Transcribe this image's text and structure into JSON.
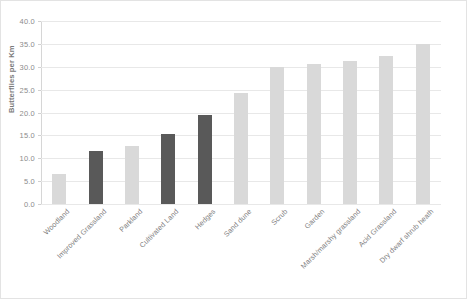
{
  "chart_data": {
    "type": "bar",
    "title": "",
    "xlabel": "",
    "ylabel": "Butterflies per Km",
    "ylim": [
      0.0,
      40.0
    ],
    "ytick_step": 5.0,
    "ytick_labels": [
      "0.0",
      "5.0",
      "10.0",
      "15.0",
      "20.0",
      "25.0",
      "30.0",
      "35.0",
      "40.0"
    ],
    "ytick_values": [
      0.0,
      5.0,
      10.0,
      15.0,
      20.0,
      25.0,
      30.0,
      35.0,
      40.0
    ],
    "grid": true,
    "legend": "none",
    "categories": [
      "Woodland",
      "Improved Grassland",
      "Parkland",
      "Cultivated Land",
      "Hedges",
      "Sand dune",
      "Scrub",
      "Garden",
      "Marsh/marshy grassland",
      "Acid Grassland",
      "Dry dwarf shrub heath"
    ],
    "values": [
      6.5,
      11.5,
      12.7,
      15.3,
      19.5,
      24.3,
      30.0,
      30.6,
      31.3,
      32.3,
      35.0
    ],
    "bar_shades": [
      "light",
      "dark",
      "light",
      "dark",
      "dark",
      "light",
      "light",
      "light",
      "light",
      "light",
      "light"
    ],
    "colors": {
      "light_bar": "#d9d9d9",
      "dark_bar": "#595959",
      "gridline": "#e8e8e8",
      "axis": "#d6d6d6",
      "text": "#7d7d7d",
      "background": "#ffffff",
      "frame_border": "#e3e3e3"
    }
  }
}
